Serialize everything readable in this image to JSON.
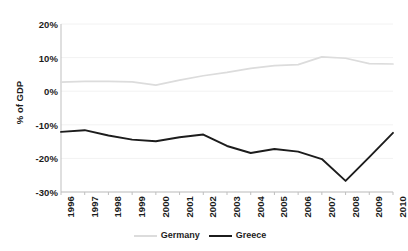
{
  "chart_data": {
    "type": "line",
    "title": "",
    "xlabel": "",
    "ylabel": "% of GDP",
    "categories": [
      "1996",
      "1997",
      "1998",
      "1999",
      "2000",
      "2001",
      "2002",
      "2003",
      "2004",
      "2005",
      "2006",
      "2007",
      "2008",
      "2009",
      "2010"
    ],
    "x": [
      1996,
      1997,
      1998,
      1999,
      2000,
      2001,
      2002,
      2003,
      2004,
      2005,
      2006,
      2007,
      2008,
      2009,
      2010
    ],
    "ylim": [
      -30,
      20
    ],
    "yticks": [
      20,
      10,
      0,
      -10,
      -20,
      -30
    ],
    "ytick_labels": [
      "20%",
      "10%",
      "0%",
      "-10%",
      "-20%",
      "-30%"
    ],
    "grid": true,
    "legend_position": "bottom",
    "series": [
      {
        "name": "Germany",
        "color": "#dcdcdc",
        "values": [
          2.7,
          2.9,
          2.9,
          2.8,
          1.8,
          3.3,
          4.6,
          5.6,
          6.8,
          7.6,
          7.9,
          10.2,
          9.8,
          8.2,
          8.1
        ]
      },
      {
        "name": "Greece",
        "color": "#1c1c1c",
        "values": [
          -12.1,
          -11.6,
          -13.2,
          -14.4,
          -14.9,
          -13.7,
          -12.9,
          -16.3,
          -18.4,
          -17.2,
          -18.0,
          -20.2,
          -26.7,
          -19.6,
          -12.4
        ]
      }
    ]
  },
  "axes": {
    "y_title": "% of GDP",
    "y_ticks": [
      "20%",
      "10%",
      "0%",
      "-10%",
      "-20%",
      "-30%"
    ],
    "x_ticks": [
      "1996",
      "1997",
      "1998",
      "1999",
      "2000",
      "2001",
      "2002",
      "2003",
      "2004",
      "2005",
      "2006",
      "2007",
      "2008",
      "2009",
      "2010"
    ]
  },
  "legend": {
    "items": [
      {
        "label": "Germany"
      },
      {
        "label": "Greece"
      }
    ]
  },
  "colors": {
    "germany_line": "#dcdcdc",
    "greece_line": "#1c1c1c",
    "gridline": "#f2f2f2",
    "axis": "#bfbfbf",
    "text": "#1c1c1c",
    "background": "#ffffff"
  }
}
